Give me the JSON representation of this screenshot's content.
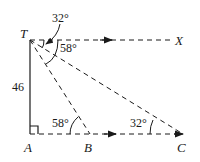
{
  "diagram": {
    "points": {
      "T": {
        "label": "T",
        "x": 30,
        "y": 40
      },
      "A": {
        "label": "A",
        "x": 30,
        "y": 134
      },
      "B": {
        "label": "B",
        "x": 90,
        "y": 134
      },
      "C": {
        "label": "C",
        "x": 183,
        "y": 134
      },
      "X": {
        "label": "X",
        "x": 178,
        "y": 40
      }
    },
    "labels": {
      "T": "T",
      "A": "A",
      "B": "B",
      "C": "C",
      "X": "X",
      "height": "46",
      "angle_top_32": "32°",
      "angle_top_58": "58°",
      "angle_B": "58°",
      "angle_C": "32°"
    },
    "colors": {
      "ink": "#1a1a1a",
      "background": "#ffffff"
    }
  }
}
